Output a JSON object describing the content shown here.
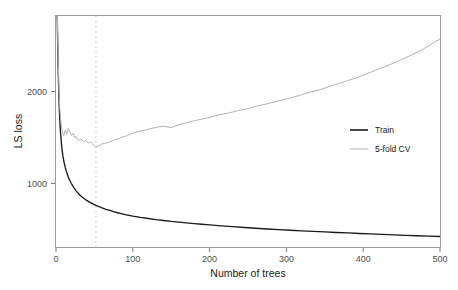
{
  "chart_data": {
    "type": "line",
    "title": "",
    "xlabel": "Number of trees",
    "ylabel": "LS loss",
    "xlim": [
      0,
      500
    ],
    "ylim": [
      310,
      2820
    ],
    "grid": false,
    "xticks": [
      0,
      100,
      200,
      300,
      400,
      500
    ],
    "xtick_labels": [
      "0",
      "100",
      "200",
      "300",
      "400",
      "500"
    ],
    "yticks": [
      1000,
      2000
    ],
    "ytick_labels": [
      "1000",
      "2000"
    ],
    "legend_position": "center-right",
    "annotations": [
      {
        "type": "vertical-dashed-line",
        "x": 52,
        "label": "",
        "color": "#cccccc"
      }
    ],
    "series": [
      {
        "name": "Train",
        "color": "#1a1a1a",
        "x": [
          1,
          2,
          3,
          4,
          5,
          6,
          7,
          8,
          9,
          10,
          12,
          14,
          16,
          18,
          20,
          23,
          26,
          29,
          32,
          36,
          40,
          44,
          48,
          52,
          56,
          60,
          65,
          70,
          75,
          80,
          85,
          90,
          95,
          100,
          110,
          120,
          130,
          140,
          150,
          160,
          170,
          180,
          190,
          200,
          215,
          230,
          245,
          260,
          275,
          290,
          305,
          320,
          335,
          350,
          365,
          380,
          395,
          410,
          425,
          440,
          455,
          470,
          485,
          500
        ],
        "y": [
          3150,
          2620,
          2180,
          1870,
          1680,
          1540,
          1440,
          1360,
          1300,
          1250,
          1175,
          1118,
          1070,
          1032,
          1000,
          958,
          922,
          893,
          868,
          840,
          816,
          795,
          778,
          762,
          748,
          735,
          720,
          707,
          694,
          682,
          672,
          662,
          654,
          646,
          632,
          620,
          608,
          598,
          588,
          580,
          572,
          564,
          557,
          550,
          540,
          531,
          522,
          514,
          506,
          499,
          492,
          486,
          480,
          474,
          468,
          463,
          457,
          452,
          447,
          442,
          437,
          432,
          428,
          424
        ]
      },
      {
        "name": "5-fold CV",
        "color": "#b3b3b3",
        "x": [
          1,
          2,
          3,
          4,
          5,
          6,
          7,
          8,
          9,
          10,
          12,
          14,
          16,
          18,
          20,
          22,
          24,
          26,
          28,
          30,
          33,
          36,
          39,
          42,
          45,
          48,
          52,
          56,
          60,
          65,
          70,
          75,
          80,
          85,
          90,
          95,
          100,
          108,
          116,
          124,
          132,
          140,
          150,
          160,
          170,
          180,
          190,
          200,
          212,
          224,
          236,
          248,
          260,
          272,
          284,
          296,
          308,
          320,
          332,
          344,
          356,
          368,
          380,
          392,
          404,
          416,
          428,
          440,
          452,
          464,
          476,
          488,
          500
        ],
        "y": [
          3200,
          2700,
          2280,
          1990,
          1810,
          1700,
          1630,
          1582,
          1548,
          1520,
          1580,
          1535,
          1600,
          1560,
          1520,
          1545,
          1500,
          1512,
          1478,
          1470,
          1482,
          1455,
          1468,
          1440,
          1450,
          1425,
          1395,
          1412,
          1430,
          1440,
          1452,
          1470,
          1482,
          1500,
          1512,
          1530,
          1548,
          1566,
          1580,
          1598,
          1612,
          1622,
          1608,
          1640,
          1660,
          1682,
          1700,
          1718,
          1745,
          1765,
          1790,
          1810,
          1838,
          1860,
          1885,
          1910,
          1935,
          1965,
          1995,
          2020,
          2055,
          2085,
          2120,
          2150,
          2190,
          2230,
          2270,
          2310,
          2355,
          2400,
          2450,
          2510,
          2570
        ]
      }
    ]
  },
  "legend": {
    "items": [
      {
        "label": "Train",
        "color": "#1a1a1a"
      },
      {
        "label": "5-fold CV",
        "color": "#b3b3b3"
      }
    ]
  },
  "axes": {
    "x_title": "Number of trees",
    "y_title": "LS loss"
  }
}
